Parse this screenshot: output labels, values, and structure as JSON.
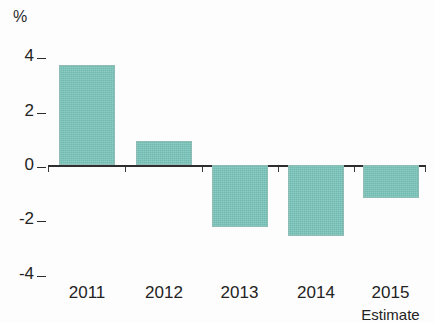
{
  "chart_data": {
    "type": "bar",
    "title": "",
    "subtitle": "",
    "xlabel": "",
    "ylabel": "%",
    "unit_label": "%",
    "categories": [
      "2011",
      "2012",
      "2013",
      "2014",
      "2015"
    ],
    "category_sublabels": [
      "",
      "",
      "",
      "",
      "Estimate"
    ],
    "values": [
      3.7,
      0.9,
      -2.3,
      -2.6,
      -1.2
    ],
    "series": [
      {
        "name": "",
        "values": [
          3.7,
          0.9,
          -2.3,
          -2.6,
          -1.2
        ]
      }
    ],
    "ylim": [
      -4,
      4
    ],
    "yticks": [
      4,
      2,
      0,
      -2,
      -4
    ],
    "ytick_labels": [
      "4",
      "2",
      "0",
      "-2",
      "-4"
    ],
    "grid": false,
    "legend": "none",
    "bar_color": "#79c4ba",
    "axis_color": "#2e2e2e",
    "text_color": "#232323",
    "background_color": "#fdfdfd"
  },
  "axis": {
    "unit": "%",
    "ticks": [
      {
        "label": "4",
        "value": 4
      },
      {
        "label": "2",
        "value": 2
      },
      {
        "label": "0",
        "value": 0
      },
      {
        "label": "-2",
        "value": -2
      },
      {
        "label": "-4",
        "value": -4
      }
    ]
  },
  "bars": [
    {
      "category": "2011",
      "sublabel": "",
      "value": 3.7
    },
    {
      "category": "2012",
      "sublabel": "",
      "value": 0.9
    },
    {
      "category": "2013",
      "sublabel": "",
      "value": -2.3
    },
    {
      "category": "2014",
      "sublabel": "",
      "value": -2.6
    },
    {
      "category": "2015",
      "sublabel": "Estimate",
      "value": -1.2
    }
  ]
}
